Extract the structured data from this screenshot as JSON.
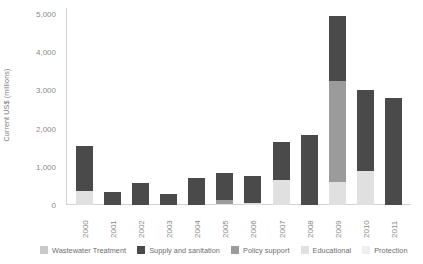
{
  "chart_data": {
    "type": "bar",
    "stacked": true,
    "title": "",
    "xlabel": "",
    "ylabel": "Current US$ (millions)",
    "ylim": [
      0,
      5000
    ],
    "yticks": [
      0,
      1000,
      2000,
      3000,
      4000,
      5000
    ],
    "ytick_labels": [
      "0",
      "1,000",
      "2,000",
      "3,000",
      "4,000",
      "5,000"
    ],
    "grid": false,
    "legend_position": "bottom",
    "categories": [
      "2000",
      "2001",
      "2002",
      "2003",
      "2004",
      "2005",
      "2006",
      "2007",
      "2008",
      "2009",
      "2010",
      "2011"
    ],
    "series": [
      {
        "name": "Wastewater Treatment",
        "color": "#c9c9c9",
        "values": [
          0,
          0,
          0,
          0,
          0,
          0,
          0,
          0,
          0,
          0,
          0,
          0
        ]
      },
      {
        "name": "Supply and sanitation",
        "color": "#4a4a4a",
        "values": [
          1180,
          350,
          580,
          300,
          700,
          700,
          690,
          1000,
          1830,
          1700,
          2100,
          2800
        ]
      },
      {
        "name": "Policy support",
        "color": "#9b9b9b",
        "values": [
          0,
          0,
          0,
          0,
          0,
          110,
          0,
          0,
          0,
          2650,
          0,
          0
        ]
      },
      {
        "name": "Educational",
        "color": "#e0e0e0",
        "values": [
          370,
          0,
          0,
          0,
          0,
          20,
          60,
          650,
          0,
          600,
          900,
          0
        ]
      },
      {
        "name": "Protection",
        "color": "#efefef",
        "values": [
          0,
          0,
          0,
          0,
          0,
          0,
          0,
          0,
          0,
          0,
          0,
          0
        ]
      }
    ],
    "totals": [
      1550,
      350,
      580,
      300,
      700,
      830,
      750,
      1650,
      1830,
      4950,
      3000,
      2800
    ]
  },
  "legend": {
    "items": [
      {
        "label": "Wastewater Treatment",
        "color": "#c9c9c9"
      },
      {
        "label": "Supply and sanitation",
        "color": "#4a4a4a"
      },
      {
        "label": "Policy support",
        "color": "#9b9b9b"
      },
      {
        "label": "Educational",
        "color": "#e0e0e0"
      },
      {
        "label": "Protection",
        "color": "#efefef"
      }
    ]
  }
}
